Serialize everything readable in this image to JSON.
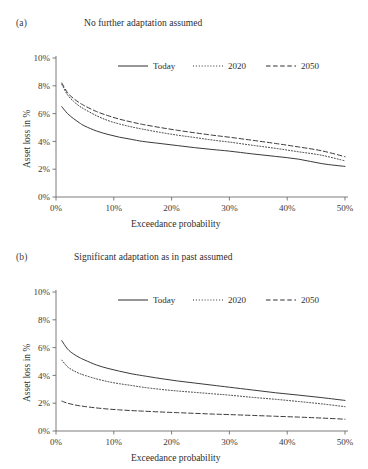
{
  "figure": {
    "panels": [
      {
        "letter": "(a)",
        "title": "No further adaptation assumed",
        "xlabel": "Exceedance probability",
        "ylabel": "Asset loss in %"
      },
      {
        "letter": "(b)",
        "title": "Significant adaptation as in past assumed",
        "xlabel": "Exceedance probability",
        "ylabel": "Asset loss in %"
      }
    ]
  },
  "chart_data": [
    {
      "type": "line",
      "title": "No further adaptation assumed",
      "panel": "(a)",
      "xlabel": "Exceedance probability",
      "ylabel": "Asset loss in %",
      "xlim": [
        0,
        50
      ],
      "ylim": [
        0,
        10
      ],
      "xticks": [
        0,
        10,
        20,
        30,
        40,
        50
      ],
      "xticklabels": [
        "0%",
        "10%",
        "20%",
        "30%",
        "40%",
        "50%"
      ],
      "yticks": [
        0,
        2,
        4,
        6,
        8,
        10
      ],
      "yticklabels": [
        "0%",
        "2%",
        "4%",
        "6%",
        "8%",
        "10%"
      ],
      "grid": false,
      "legend_position": "top-center",
      "x": [
        1,
        2,
        3,
        4,
        5,
        7,
        9,
        11,
        13,
        15,
        18,
        21,
        24,
        27,
        30,
        34,
        38,
        42,
        46,
        50
      ],
      "series": [
        {
          "name": "Today",
          "style": "solid",
          "values": [
            6.5,
            6.0,
            5.65,
            5.35,
            5.1,
            4.75,
            4.5,
            4.3,
            4.15,
            4.0,
            3.85,
            3.7,
            3.55,
            3.42,
            3.3,
            3.1,
            2.92,
            2.72,
            2.4,
            2.2
          ]
        },
        {
          "name": "2020",
          "style": "dotted",
          "values": [
            8.1,
            7.35,
            6.9,
            6.55,
            6.3,
            5.85,
            5.5,
            5.25,
            5.05,
            4.88,
            4.65,
            4.45,
            4.28,
            4.1,
            3.95,
            3.72,
            3.5,
            3.25,
            3.0,
            2.6
          ]
        },
        {
          "name": "2050",
          "style": "dashed",
          "values": [
            8.2,
            7.5,
            7.1,
            6.8,
            6.55,
            6.15,
            5.85,
            5.6,
            5.4,
            5.22,
            5.0,
            4.8,
            4.62,
            4.45,
            4.3,
            4.08,
            3.85,
            3.6,
            3.32,
            2.9
          ]
        }
      ]
    },
    {
      "type": "line",
      "title": "Significant adaptation as in past assumed",
      "panel": "(b)",
      "xlabel": "Exceedance probability",
      "ylabel": "Asset loss in %",
      "xlim": [
        0,
        50
      ],
      "ylim": [
        0,
        10
      ],
      "xticks": [
        0,
        10,
        20,
        30,
        40,
        50
      ],
      "xticklabels": [
        "0%",
        "10%",
        "20%",
        "30%",
        "40%",
        "50%"
      ],
      "yticks": [
        0,
        2,
        4,
        6,
        8,
        10
      ],
      "yticklabels": [
        "0%",
        "2%",
        "4%",
        "6%",
        "8%",
        "10%"
      ],
      "grid": false,
      "legend_position": "top-center",
      "x": [
        1,
        2,
        3,
        4,
        5,
        7,
        9,
        11,
        13,
        15,
        18,
        21,
        24,
        27,
        30,
        34,
        38,
        42,
        46,
        50
      ],
      "series": [
        {
          "name": "Today",
          "style": "solid",
          "values": [
            6.5,
            5.9,
            5.55,
            5.3,
            5.1,
            4.75,
            4.5,
            4.3,
            4.12,
            3.98,
            3.78,
            3.6,
            3.45,
            3.3,
            3.15,
            2.95,
            2.75,
            2.58,
            2.4,
            2.2
          ]
        },
        {
          "name": "2020",
          "style": "dotted",
          "values": [
            5.1,
            4.62,
            4.35,
            4.15,
            4.0,
            3.75,
            3.55,
            3.4,
            3.28,
            3.15,
            3.0,
            2.88,
            2.78,
            2.68,
            2.58,
            2.42,
            2.28,
            2.12,
            1.95,
            1.75
          ]
        },
        {
          "name": "2050",
          "style": "dashed",
          "values": [
            2.15,
            2.0,
            1.9,
            1.82,
            1.76,
            1.66,
            1.58,
            1.52,
            1.47,
            1.43,
            1.37,
            1.32,
            1.27,
            1.22,
            1.18,
            1.12,
            1.06,
            1.0,
            0.93,
            0.85
          ]
        }
      ]
    }
  ],
  "colors": {
    "axis": "#6e6e6e",
    "line": "#2f2f2f",
    "text": "#2e2e2e"
  }
}
